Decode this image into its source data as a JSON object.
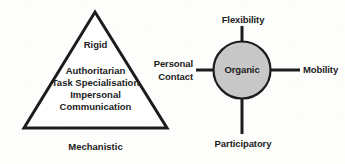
{
  "figure": {
    "background_color": "#fdfdfc",
    "stroke_color": "#1c1c1c",
    "fill_gray": "#c8c8c8",
    "text_color": "#1c1c1c"
  },
  "mechanistic": {
    "shape": "triangle",
    "caption": "Mechanistic",
    "apex_label": "Rigid",
    "body_lines": [
      "Authoritarian",
      "Task Specialisation",
      "Impersonal",
      "Communication"
    ]
  },
  "organic": {
    "shape": "circle",
    "center_label": "Organic",
    "spokes": [
      {
        "position": "top",
        "label": "Flexibility"
      },
      {
        "position": "right",
        "label": "Mobility"
      },
      {
        "position": "bottom",
        "label": "Participatory"
      },
      {
        "position": "left",
        "label": "Personal\nContact",
        "lines": [
          "Personal",
          "Contact"
        ]
      }
    ]
  }
}
